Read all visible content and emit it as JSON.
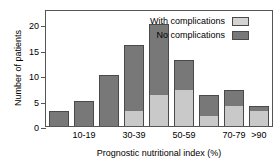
{
  "chart_data": {
    "type": "bar",
    "title": "",
    "xlabel": "Prognostic nutritional index (%)",
    "ylabel": "Number of patients",
    "ylim": [
      0,
      23
    ],
    "yticks": [
      0,
      5,
      10,
      15,
      20
    ],
    "ytick_labels": [
      "0",
      "5",
      "10",
      "15",
      "20"
    ],
    "grid": false,
    "stacked": true,
    "legend_position": "top-right",
    "categories": [
      "0-9",
      "10-19",
      "20-29",
      "30-39",
      "40-49",
      "50-59",
      "60-69",
      "70-79",
      ">90"
    ],
    "visible_xtick_labels": [
      "10-19",
      "30-39",
      "50-59",
      "70-79",
      ">90"
    ],
    "series": [
      {
        "name": "With complications",
        "color": "#c9c9c9",
        "values": [
          0,
          0,
          0,
          3,
          6,
          7,
          2,
          4,
          3
        ]
      },
      {
        "name": "No complications",
        "color": "#787878",
        "values": [
          3,
          5,
          10,
          13,
          14,
          6,
          4,
          3,
          1
        ]
      }
    ],
    "totals": [
      3,
      5,
      10,
      16,
      20,
      13,
      6,
      7,
      4
    ]
  },
  "legend": {
    "items": [
      {
        "label": "With complications",
        "swatch": "light"
      },
      {
        "label": "No complications",
        "swatch": "dark"
      }
    ]
  }
}
